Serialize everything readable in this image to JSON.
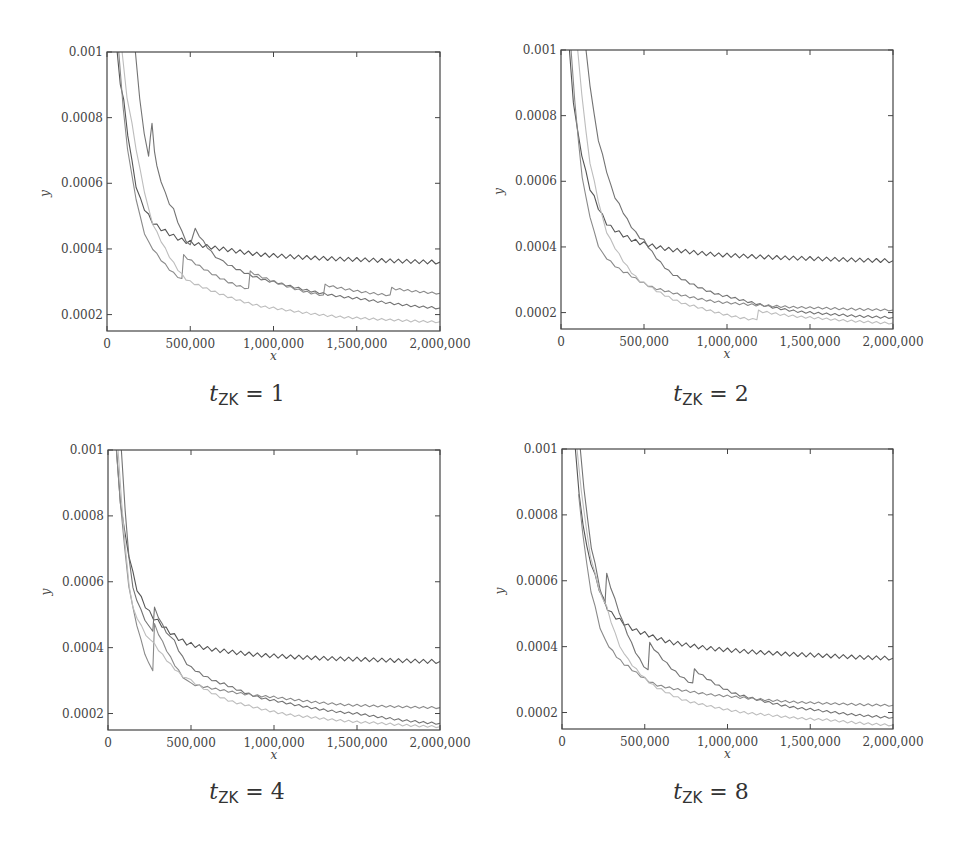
{
  "figure": {
    "colors": {
      "series_dark": "#555555",
      "series_mid": "#737373",
      "series_gray": "#8a8a8a",
      "series_light": "#bdbdbd",
      "frame": "#444444"
    }
  },
  "chart_data": [
    {
      "type": "line",
      "title": "t_ZK = 1",
      "caption": {
        "var": "t",
        "sub": "ZK",
        "rest": " = 1"
      },
      "xlabel": "x",
      "ylabel": "y",
      "xlim": [
        0,
        2000000
      ],
      "ylim": [
        0.00015,
        0.001
      ],
      "xticks": [
        0,
        500000,
        1000000,
        1500000,
        2000000
      ],
      "xtick_labels": [
        "0",
        "500,000",
        "1,000,000",
        "1,500,000",
        "2,000,000"
      ],
      "yticks": [
        0.0002,
        0.0004,
        0.0006,
        0.0008,
        0.001
      ],
      "ytick_labels": [
        "0.0002",
        "0.0004",
        "0.0006",
        "0.0008",
        "0.001"
      ],
      "grid": false,
      "legend": null,
      "series": [
        {
          "name": "series-1",
          "color": "#555555",
          "x": [
            60000,
            100000,
            200000,
            300000,
            500000,
            700000,
            1000000,
            1500000,
            2000000
          ],
          "values": [
            0.001,
            0.00085,
            0.00055,
            0.00047,
            0.00042,
            0.0004,
            0.00038,
            0.000368,
            0.00036
          ]
        },
        {
          "name": "series-2",
          "color": "#737373",
          "x": [
            170000,
            250000,
            270000,
            300000,
            400000,
            500000,
            530000,
            700000,
            1000000,
            1500000,
            2000000
          ],
          "values": [
            0.001,
            0.00068,
            0.00078,
            0.00065,
            0.00052,
            0.00041,
            0.00046,
            0.00036,
            0.0003,
            0.00025,
            0.00022
          ]
        },
        {
          "name": "series-3",
          "color": "#8a8a8a",
          "x": [
            70000,
            150000,
            250000,
            450000,
            460000,
            850000,
            860000,
            1300000,
            1310000,
            1700000,
            1710000,
            2000000
          ],
          "values": [
            0.001,
            0.00062,
            0.00042,
            0.00031,
            0.00038,
            0.00028,
            0.00033,
            0.00026,
            0.00029,
            0.00026,
            0.00028,
            0.000265
          ]
        },
        {
          "name": "series-4",
          "color": "#bdbdbd",
          "x": [
            90000,
            150000,
            300000,
            500000,
            1000000,
            1500000,
            2000000
          ],
          "values": [
            0.001,
            0.00078,
            0.00045,
            0.0003,
            0.00022,
            0.00019,
            0.000178
          ]
        }
      ]
    },
    {
      "type": "line",
      "title": "t_ZK = 2",
      "caption": {
        "var": "t",
        "sub": "ZK",
        "rest": " = 2"
      },
      "xlabel": "x",
      "ylabel": "y",
      "xlim": [
        0,
        2000000
      ],
      "ylim": [
        0.00015,
        0.001
      ],
      "xticks": [
        0,
        500000,
        1000000,
        1500000,
        2000000
      ],
      "xtick_labels": [
        "0",
        "500,000",
        "1,000,000",
        "1,500,000",
        "2,000,000"
      ],
      "yticks": [
        0.0002,
        0.0004,
        0.0006,
        0.0008,
        0.001
      ],
      "ytick_labels": [
        "0.0002",
        "0.0004",
        "0.0006",
        "0.0008",
        "0.001"
      ],
      "grid": false,
      "legend": null,
      "series": [
        {
          "name": "series-1",
          "color": "#555555",
          "x": [
            50000,
            100000,
            200000,
            300000,
            500000,
            700000,
            1000000,
            1500000,
            2000000
          ],
          "values": [
            0.001,
            0.00075,
            0.00055,
            0.00046,
            0.00041,
            0.00039,
            0.000375,
            0.000365,
            0.000358
          ]
        },
        {
          "name": "series-2",
          "color": "#737373",
          "x": [
            150000,
            250000,
            350000,
            500000,
            700000,
            1000000,
            1500000,
            2000000
          ],
          "values": [
            0.001,
            0.00068,
            0.00053,
            0.00042,
            0.00031,
            0.00025,
            0.0002,
            0.000185
          ]
        },
        {
          "name": "series-3",
          "color": "#8a8a8a",
          "x": [
            60000,
            150000,
            250000,
            400000,
            600000,
            1000000,
            1500000,
            2000000
          ],
          "values": [
            0.001,
            0.00055,
            0.00038,
            0.00032,
            0.00027,
            0.00023,
            0.000215,
            0.000208
          ]
        },
        {
          "name": "series-4",
          "color": "#bdbdbd",
          "x": [
            100000,
            200000,
            300000,
            500000,
            800000,
            1180000,
            1190000,
            1500000,
            2000000
          ],
          "values": [
            0.001,
            0.0006,
            0.00042,
            0.00029,
            0.00022,
            0.000178,
            0.000205,
            0.000185,
            0.000168
          ]
        }
      ]
    },
    {
      "type": "line",
      "title": "t_ZK = 4",
      "caption": {
        "var": "t",
        "sub": "ZK",
        "rest": " = 4"
      },
      "xlabel": "x",
      "ylabel": "y",
      "xlim": [
        0,
        2000000
      ],
      "ylim": [
        0.00015,
        0.001
      ],
      "xticks": [
        0,
        500000,
        1000000,
        1500000,
        2000000
      ],
      "xtick_labels": [
        "0",
        "500,000",
        "1,000,000",
        "1,500,000",
        "2,000,000"
      ],
      "yticks": [
        0.0002,
        0.0004,
        0.0006,
        0.0008,
        0.001
      ],
      "ytick_labels": [
        "0.0002",
        "0.0004",
        "0.0006",
        "0.0008",
        "0.001"
      ],
      "grid": false,
      "legend": null,
      "series": [
        {
          "name": "series-1",
          "color": "#555555",
          "x": [
            50000,
            100000,
            200000,
            300000,
            500000,
            700000,
            1000000,
            1500000,
            2000000
          ],
          "values": [
            0.001,
            0.00075,
            0.00055,
            0.00048,
            0.00041,
            0.00039,
            0.000375,
            0.000365,
            0.000358
          ]
        },
        {
          "name": "series-2",
          "color": "#737373",
          "x": [
            80000,
            150000,
            270000,
            280000,
            400000,
            500000,
            700000,
            1000000,
            1500000,
            2000000
          ],
          "values": [
            0.001,
            0.00058,
            0.00045,
            0.00052,
            0.00042,
            0.00034,
            0.00029,
            0.00024,
            0.0002,
            0.00017
          ]
        },
        {
          "name": "series-3",
          "color": "#8a8a8a",
          "x": [
            50000,
            150000,
            270000,
            280000,
            500000,
            1000000,
            1500000,
            2000000
          ],
          "values": [
            0.001,
            0.00052,
            0.00033,
            0.00047,
            0.00029,
            0.00025,
            0.000225,
            0.000218
          ]
        },
        {
          "name": "series-4",
          "color": "#bdbdbd",
          "x": [
            60000,
            150000,
            280000,
            500000,
            800000,
            1200000,
            1600000,
            2000000
          ],
          "values": [
            0.001,
            0.00052,
            0.00041,
            0.0003,
            0.00023,
            0.00019,
            0.000172,
            0.00016
          ]
        }
      ]
    },
    {
      "type": "line",
      "title": "t_ZK = 8",
      "caption": {
        "var": "t",
        "sub": "ZK",
        "rest": " = 8"
      },
      "xlabel": "x",
      "ylabel": "y",
      "xlim": [
        0,
        2000000
      ],
      "ylim": [
        0.00015,
        0.001
      ],
      "xticks": [
        0,
        500000,
        1000000,
        1500000,
        2000000
      ],
      "xtick_labels": [
        "0",
        "500,000",
        "1,000,000",
        "1,500,000",
        "2,000,000"
      ],
      "yticks": [
        0.0002,
        0.0004,
        0.0006,
        0.0008,
        0.001
      ],
      "ytick_labels": [
        "0.0002",
        "0.0004",
        "0.0006",
        "0.0008",
        "0.001"
      ],
      "grid": false,
      "legend": null,
      "series": [
        {
          "name": "series-1",
          "color": "#555555",
          "x": [
            80000,
            150000,
            300000,
            500000,
            700000,
            1000000,
            1500000,
            2000000
          ],
          "values": [
            0.001,
            0.0007,
            0.0005,
            0.00044,
            0.00041,
            0.00039,
            0.000375,
            0.000365
          ]
        },
        {
          "name": "series-2",
          "color": "#737373",
          "x": [
            110000,
            200000,
            260000,
            270000,
            520000,
            530000,
            790000,
            800000,
            1100000,
            1500000,
            2000000
          ],
          "values": [
            0.001,
            0.00065,
            0.00053,
            0.00062,
            0.00033,
            0.00041,
            0.00029,
            0.00033,
            0.00025,
            0.00021,
            0.000185
          ]
        },
        {
          "name": "series-3",
          "color": "#8a8a8a",
          "x": [
            100000,
            200000,
            260000,
            400000,
            600000,
            1000000,
            1500000,
            2000000
          ],
          "values": [
            0.00086,
            0.00052,
            0.00042,
            0.00034,
            0.00028,
            0.00025,
            0.00023,
            0.000222
          ]
        },
        {
          "name": "series-4",
          "color": "#bdbdbd",
          "x": [
            90000,
            200000,
            270000,
            400000,
            600000,
            800000,
            1200000,
            1600000,
            2000000
          ],
          "values": [
            0.001,
            0.00062,
            0.00052,
            0.00036,
            0.00027,
            0.00023,
            0.000195,
            0.000178,
            0.000162
          ]
        }
      ]
    }
  ],
  "layout": {
    "panels": [
      {
        "left": 107,
        "top": 52,
        "width": 333,
        "height": 279,
        "caption_x": 247,
        "caption_y": 381
      },
      {
        "left": 561,
        "top": 50,
        "width": 332,
        "height": 279,
        "caption_x": 711,
        "caption_y": 381
      },
      {
        "left": 108,
        "top": 450,
        "width": 332,
        "height": 280,
        "caption_x": 247,
        "caption_y": 779
      },
      {
        "left": 562,
        "top": 449,
        "width": 331,
        "height": 280,
        "caption_x": 711,
        "caption_y": 779
      }
    ]
  }
}
